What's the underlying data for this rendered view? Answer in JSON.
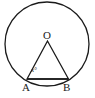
{
  "figure": {
    "type": "geometry-diagram",
    "background_color": "#ffffff",
    "stroke_color": "#1a1a1a",
    "label_color": "#1a1a1a",
    "stroke_width": 1.3,
    "labels": {
      "center": "O",
      "point_a": "A",
      "point_b": "B",
      "angle": "x°"
    },
    "geometry": {
      "circle": {
        "cx": 47,
        "cy": 44,
        "r": 42
      },
      "vertex_o": {
        "x": 47.5,
        "y": 41
      },
      "vertex_a": {
        "x": 27,
        "y": 79
      },
      "vertex_b": {
        "x": 68.5,
        "y": 79
      },
      "triangle_path": "M 47.5 41 L 27 79 L 68.5 79 Z",
      "chord_ab": {
        "x1": 27,
        "y1": 79,
        "x2": 68.5,
        "y2": 79
      }
    }
  }
}
